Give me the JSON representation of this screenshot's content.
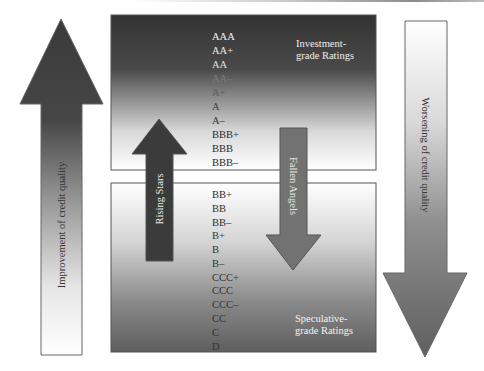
{
  "diagram": {
    "left_arrow": {
      "label": "Improvement of credit quality"
    },
    "right_arrow": {
      "label": "Worsening of credit quality"
    },
    "rising_arrow": {
      "label": "Rising Stars"
    },
    "falling_arrow": {
      "label": "Fallen Angels"
    },
    "investment_box": {
      "title_line1": "Investment-",
      "title_line2": "grade Ratings",
      "ratings": [
        "AAA",
        "AA+",
        "AA",
        "AA–",
        "A+",
        "A",
        "A–",
        "BBB+",
        "BBB",
        "BBB–"
      ]
    },
    "speculative_box": {
      "title_line1": "Speculative-",
      "title_line2": "grade Ratings",
      "ratings": [
        "BB+",
        "BB",
        "BB–",
        "B+",
        "B",
        "B–",
        "CCC+",
        "CCC",
        "CCC–",
        "CC",
        "C",
        "D"
      ]
    },
    "colors": {
      "dark": "#3a3a3a",
      "mid": "#6e6e6e",
      "light": "#ffffff",
      "border": "#555555"
    }
  }
}
